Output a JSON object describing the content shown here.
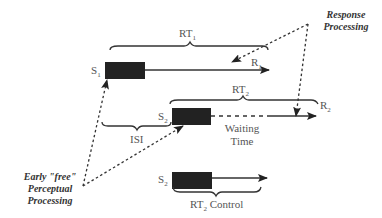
{
  "diagram": {
    "colors": {
      "stimulus_box": "#222222",
      "line": "#333333",
      "label": "#555555"
    },
    "trial1": {
      "stimulus": {
        "label": "S",
        "sub": "1"
      },
      "response": {
        "label": "R",
        "sub": "1"
      },
      "interval": {
        "label": "RT",
        "sub": "1"
      }
    },
    "trial2": {
      "stimulus": {
        "label": "S",
        "sub": "2"
      },
      "response": {
        "label": "R",
        "sub": "2"
      },
      "interval": {
        "label": "RT",
        "sub": "2"
      },
      "isi_label": "ISI",
      "waiting_label_line1": "Waiting",
      "waiting_label_line2": "Time"
    },
    "control": {
      "stimulus": {
        "label": "S",
        "sub": "2"
      },
      "interval": {
        "label": "RT",
        "sub": "2",
        "suffix": " Control"
      }
    },
    "annotations": {
      "response_processing_line1": "Response",
      "response_processing_line2": "Processing",
      "early_free_line1": "Early \"free\"",
      "early_free_line2": "Perceptual",
      "early_free_line3": "Processing"
    }
  }
}
